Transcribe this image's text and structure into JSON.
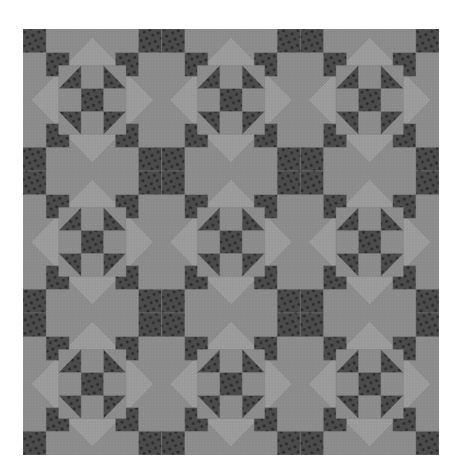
{
  "image": {
    "subject": "quilt",
    "description": "Repeating 3x3 grid of identical pieced quilt blocks with dark polka-dot fabric on gray background, light diamonds and inner shoofly star motifs"
  },
  "quilt": {
    "x": 23,
    "y": 29,
    "width": 416,
    "height": 426,
    "blocks_x": 3,
    "blocks_y": 3,
    "cells_per_block": 6
  },
  "colors": {
    "background": "#ffffff",
    "medium": "#8b8b8b",
    "light": "#9a9a9a",
    "dark": "#4b4b4b",
    "dot": "#2b2b2b",
    "seam": "#7f7f7f"
  }
}
